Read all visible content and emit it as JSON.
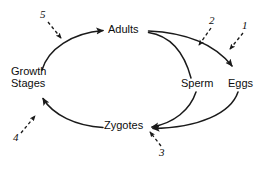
{
  "diagram": {
    "background_color": "#ffffff",
    "stroke_color": "#1a1a1a",
    "text_color": "#0d0d0d",
    "nodes": [
      {
        "id": "adults",
        "label": "Adults"
      },
      {
        "id": "growth_stages",
        "label_line1": "Growth",
        "label_line2": "Stages"
      },
      {
        "id": "sperm",
        "label": "Sperm"
      },
      {
        "id": "eggs",
        "label": "Eggs"
      },
      {
        "id": "zygotes",
        "label": "Zygotes"
      }
    ],
    "callouts": [
      {
        "id": "callout-1",
        "label": "1"
      },
      {
        "id": "callout-2",
        "label": "2"
      },
      {
        "id": "callout-3",
        "label": "3"
      },
      {
        "id": "callout-4",
        "label": "4"
      },
      {
        "id": "callout-5",
        "label": "5"
      }
    ]
  }
}
